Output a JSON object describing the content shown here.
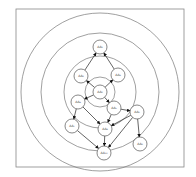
{
  "diagram": {
    "frame": {
      "x": 16,
      "y": 9,
      "width": 168,
      "height": 158,
      "stroke": "#888888"
    },
    "rings": {
      "cx": 100,
      "cy": 92,
      "radii": [
        15,
        36,
        59,
        79
      ],
      "stroke": "#777777"
    },
    "node_radius": 7,
    "nodes": [
      {
        "id": "n0",
        "label": "AA₀",
        "x": 100,
        "y": 92
      },
      {
        "id": "n1",
        "label": "AA₁",
        "x": 100,
        "y": 47
      },
      {
        "id": "n2",
        "label": "AA₂",
        "x": 81,
        "y": 76
      },
      {
        "id": "n3",
        "label": "AA₃",
        "x": 118,
        "y": 75
      },
      {
        "id": "n4",
        "label": "AA₄",
        "x": 78,
        "y": 102
      },
      {
        "id": "n5",
        "label": "AA₅",
        "x": 114,
        "y": 108
      },
      {
        "id": "n6",
        "label": "AA₆",
        "x": 137,
        "y": 112
      },
      {
        "id": "n7",
        "label": "AA₇",
        "x": 72,
        "y": 126
      },
      {
        "id": "n8",
        "label": "AA₈",
        "x": 105,
        "y": 129
      },
      {
        "id": "n9",
        "label": "AA₉",
        "x": 140,
        "y": 144
      },
      {
        "id": "n10",
        "label": "AA₁₀",
        "x": 104,
        "y": 153
      }
    ],
    "edges": [
      {
        "from": "n2",
        "to": "n1"
      },
      {
        "from": "n3",
        "to": "n1"
      },
      {
        "from": "n0",
        "to": "n2"
      },
      {
        "from": "n0",
        "to": "n3"
      },
      {
        "from": "n0",
        "to": "n4"
      },
      {
        "from": "n0",
        "to": "n5"
      },
      {
        "from": "n5",
        "to": "n6"
      },
      {
        "from": "n4",
        "to": "n7"
      },
      {
        "from": "n4",
        "to": "n8"
      },
      {
        "from": "n5",
        "to": "n8"
      },
      {
        "from": "n6",
        "to": "n8"
      },
      {
        "from": "n6",
        "to": "n9"
      },
      {
        "from": "n7",
        "to": "n10"
      },
      {
        "from": "n8",
        "to": "n10"
      },
      {
        "from": "n6",
        "to": "n10"
      }
    ],
    "colors": {
      "edge": "#222222",
      "node_stroke": "#555555",
      "node_fill": "#ffffff"
    }
  }
}
